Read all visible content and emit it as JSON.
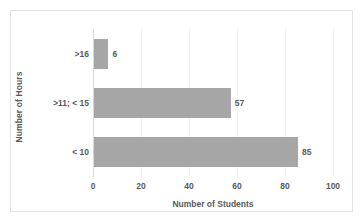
{
  "chart_data": {
    "type": "bar",
    "orientation": "horizontal",
    "title": "",
    "xlabel": "Number of Students",
    "ylabel": "Number of Hours",
    "categories": [
      "< 10",
      ">11; < 15",
      ">16"
    ],
    "values": [
      85,
      57,
      6
    ],
    "data_labels": [
      "85",
      "57",
      "6"
    ],
    "xlim": [
      0,
      100
    ],
    "xticks": [
      0,
      20,
      40,
      60,
      80,
      100
    ],
    "xtick_labels": [
      "0",
      "20",
      "40",
      "60",
      "80",
      "100"
    ],
    "grid": true,
    "legend": false,
    "bar_color": "#a6a6a6",
    "text_color": "#595959",
    "background_color": "#ffffff",
    "border_color": "#e3e3e3"
  }
}
